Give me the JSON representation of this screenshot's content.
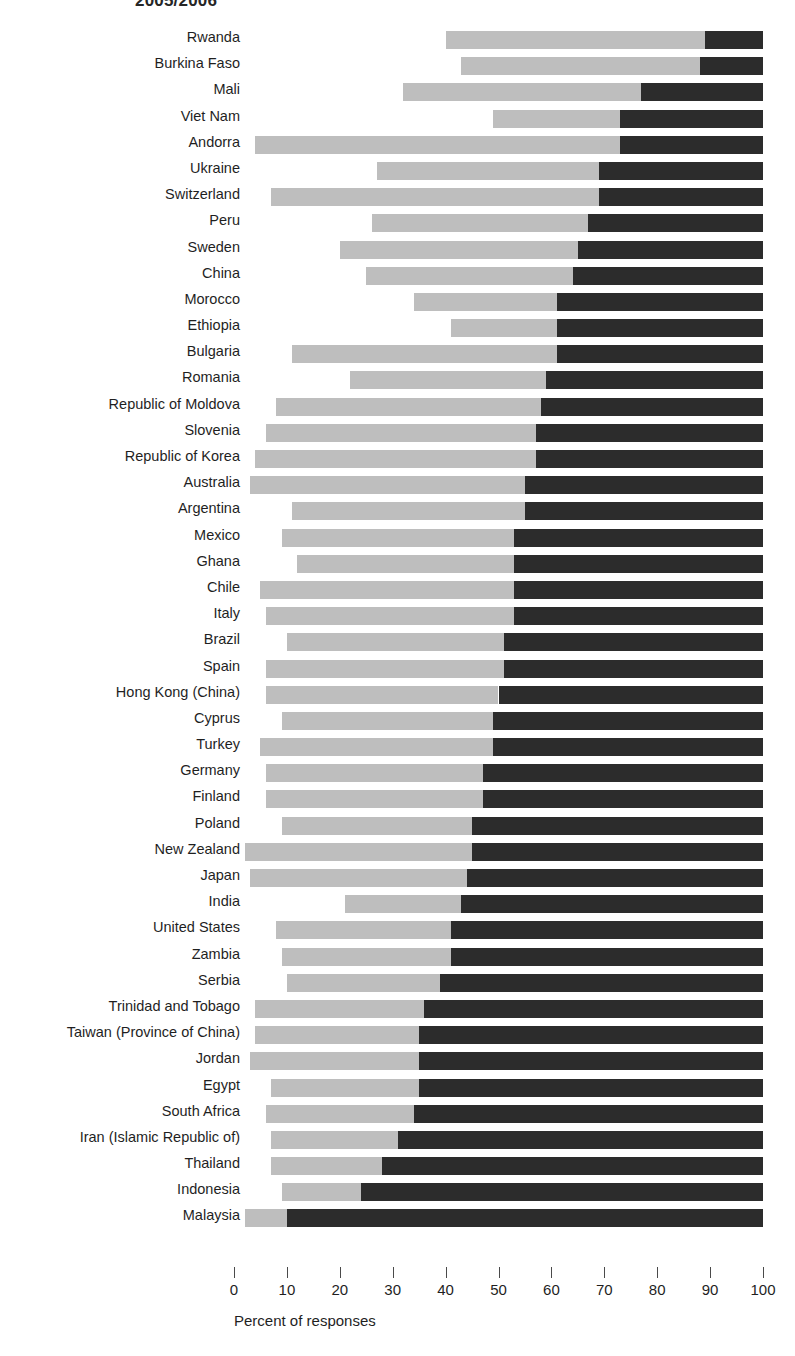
{
  "chart_data": {
    "type": "bar",
    "orientation": "horizontal",
    "stacked": true,
    "title": "2005/2006",
    "xlabel": "Percent of responses",
    "ylabel": "",
    "xlim": [
      0,
      100
    ],
    "grid": false,
    "legend_position": "none",
    "xticks": [
      0,
      10,
      20,
      30,
      40,
      50,
      60,
      70,
      80,
      90,
      100
    ],
    "xticklabels": [
      "0",
      "10",
      "20",
      "30",
      "40",
      "50",
      "60",
      "70",
      "80",
      "90",
      "100"
    ],
    "colors": {
      "segment_blank": "#ffffff",
      "segment_light": "#bebebe",
      "segment_dark": "#2c2c2c"
    },
    "categories": [
      "Rwanda",
      "Burkina Faso",
      "Mali",
      "Viet Nam",
      "Andorra",
      "Ukraine",
      "Switzerland",
      "Peru",
      "Sweden",
      "China",
      "Morocco",
      "Ethiopia",
      "Bulgaria",
      "Romania",
      "Republic of Moldova",
      "Slovenia",
      "Republic of Korea",
      "Australia",
      "Argentina",
      "Mexico",
      "Ghana",
      "Chile",
      "Italy",
      "Brazil",
      "Spain",
      "Hong Kong (China)",
      "Cyprus",
      "Turkey",
      "Germany",
      "Finland",
      "Poland",
      "New Zealand",
      "Japan",
      "India",
      "United States",
      "Zambia",
      "Serbia",
      "Trinidad and Tobago",
      "Taiwan (Province of China)",
      "Jordan",
      "Egypt",
      "South Africa",
      "Iran (Islamic Republic of)",
      "Thailand",
      "Indonesia",
      "Malaysia"
    ],
    "series": [
      {
        "name": "first",
        "color": "#ffffff",
        "values": [
          40,
          43,
          32,
          49,
          4,
          27,
          7,
          26,
          20,
          25,
          34,
          41,
          11,
          22,
          8,
          6,
          4,
          3,
          11,
          9,
          12,
          5,
          6,
          10,
          6,
          6,
          9,
          5,
          6,
          6,
          9,
          2,
          3,
          21,
          8,
          9,
          10,
          4,
          4,
          3,
          7,
          6,
          7,
          7,
          9,
          2
        ]
      },
      {
        "name": "second",
        "color": "#bebebe",
        "values": [
          49,
          45,
          45,
          24,
          69,
          42,
          62,
          41,
          45,
          39,
          27,
          20,
          50,
          37,
          50,
          51,
          53,
          52,
          44,
          44,
          41,
          48,
          47,
          41,
          45,
          44,
          40,
          44,
          41,
          41,
          36,
          43,
          41,
          22,
          33,
          32,
          29,
          32,
          31,
          32,
          28,
          28,
          24,
          21,
          15,
          8
        ]
      },
      {
        "name": "third",
        "color": "#2c2c2c",
        "values": [
          11,
          12,
          23,
          27,
          27,
          31,
          31,
          33,
          35,
          36,
          39,
          39,
          39,
          41,
          42,
          43,
          43,
          45,
          45,
          47,
          47,
          47,
          47,
          49,
          49,
          50,
          51,
          51,
          53,
          53,
          55,
          55,
          56,
          57,
          59,
          59,
          61,
          64,
          65,
          65,
          65,
          66,
          69,
          72,
          76,
          90
        ]
      }
    ],
    "rows": [
      {
        "label": "Rwanda",
        "start": 40,
        "light_end": 89,
        "dark_end": 100
      },
      {
        "label": "Burkina Faso",
        "start": 43,
        "light_end": 88,
        "dark_end": 100
      },
      {
        "label": "Mali",
        "start": 32,
        "light_end": 77,
        "dark_end": 100
      },
      {
        "label": "Viet Nam",
        "start": 49,
        "light_end": 73,
        "dark_end": 100
      },
      {
        "label": "Andorra",
        "start": 4,
        "light_end": 73,
        "dark_end": 100
      },
      {
        "label": "Ukraine",
        "start": 27,
        "light_end": 69,
        "dark_end": 100
      },
      {
        "label": "Switzerland",
        "start": 7,
        "light_end": 69,
        "dark_end": 100
      },
      {
        "label": "Peru",
        "start": 26,
        "light_end": 67,
        "dark_end": 100
      },
      {
        "label": "Sweden",
        "start": 20,
        "light_end": 65,
        "dark_end": 100
      },
      {
        "label": "China",
        "start": 25,
        "light_end": 64,
        "dark_end": 100
      },
      {
        "label": "Morocco",
        "start": 34,
        "light_end": 61,
        "dark_end": 100
      },
      {
        "label": "Ethiopia",
        "start": 41,
        "light_end": 61,
        "dark_end": 100
      },
      {
        "label": "Bulgaria",
        "start": 11,
        "light_end": 61,
        "dark_end": 100
      },
      {
        "label": "Romania",
        "start": 22,
        "light_end": 59,
        "dark_end": 100
      },
      {
        "label": "Republic of Moldova",
        "start": 8,
        "light_end": 58,
        "dark_end": 100
      },
      {
        "label": "Slovenia",
        "start": 6,
        "light_end": 57,
        "dark_end": 100
      },
      {
        "label": "Republic of Korea",
        "start": 4,
        "light_end": 57,
        "dark_end": 100
      },
      {
        "label": "Australia",
        "start": 3,
        "light_end": 55,
        "dark_end": 100
      },
      {
        "label": "Argentina",
        "start": 11,
        "light_end": 55,
        "dark_end": 100
      },
      {
        "label": "Mexico",
        "start": 9,
        "light_end": 53,
        "dark_end": 100
      },
      {
        "label": "Ghana",
        "start": 12,
        "light_end": 53,
        "dark_end": 100
      },
      {
        "label": "Chile",
        "start": 5,
        "light_end": 53,
        "dark_end": 100
      },
      {
        "label": "Italy",
        "start": 6,
        "light_end": 53,
        "dark_end": 100
      },
      {
        "label": "Brazil",
        "start": 10,
        "light_end": 51,
        "dark_end": 100
      },
      {
        "label": "Spain",
        "start": 6,
        "light_end": 51,
        "dark_end": 100
      },
      {
        "label": "Hong Kong (China)",
        "start": 6,
        "light_end": 50,
        "dark_end": 100
      },
      {
        "label": "Cyprus",
        "start": 9,
        "light_end": 49,
        "dark_end": 100
      },
      {
        "label": "Turkey",
        "start": 5,
        "light_end": 49,
        "dark_end": 100
      },
      {
        "label": "Germany",
        "start": 6,
        "light_end": 47,
        "dark_end": 100
      },
      {
        "label": "Finland",
        "start": 6,
        "light_end": 47,
        "dark_end": 100
      },
      {
        "label": "Poland",
        "start": 9,
        "light_end": 45,
        "dark_end": 100
      },
      {
        "label": "New Zealand",
        "start": 2,
        "light_end": 45,
        "dark_end": 100
      },
      {
        "label": "Japan",
        "start": 3,
        "light_end": 44,
        "dark_end": 100
      },
      {
        "label": "India",
        "start": 21,
        "light_end": 43,
        "dark_end": 100
      },
      {
        "label": "United States",
        "start": 8,
        "light_end": 41,
        "dark_end": 100
      },
      {
        "label": "Zambia",
        "start": 9,
        "light_end": 41,
        "dark_end": 100
      },
      {
        "label": "Serbia",
        "start": 10,
        "light_end": 39,
        "dark_end": 100
      },
      {
        "label": "Trinidad and Tobago",
        "start": 4,
        "light_end": 36,
        "dark_end": 100
      },
      {
        "label": "Taiwan (Province of China)",
        "start": 4,
        "light_end": 35,
        "dark_end": 100
      },
      {
        "label": "Jordan",
        "start": 3,
        "light_end": 35,
        "dark_end": 100
      },
      {
        "label": "Egypt",
        "start": 7,
        "light_end": 35,
        "dark_end": 100
      },
      {
        "label": "South Africa",
        "start": 6,
        "light_end": 34,
        "dark_end": 100
      },
      {
        "label": "Iran (Islamic Republic of)",
        "start": 7,
        "light_end": 31,
        "dark_end": 100
      },
      {
        "label": "Thailand",
        "start": 7,
        "light_end": 28,
        "dark_end": 100
      },
      {
        "label": "Indonesia",
        "start": 9,
        "light_end": 24,
        "dark_end": 100
      },
      {
        "label": "Malaysia",
        "start": 2,
        "light_end": 10,
        "dark_end": 100
      }
    ]
  }
}
